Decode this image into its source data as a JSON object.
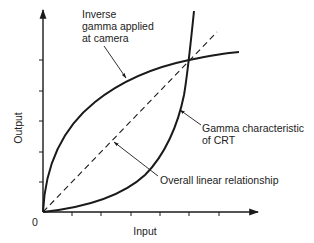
{
  "diagram": {
    "axes": {
      "x_label": "Input",
      "y_label": "Output",
      "origin_label": "0",
      "x_ticks": 6,
      "y_ticks": 5
    },
    "annotations": {
      "inverse_gamma": [
        "Inverse",
        "gamma applied",
        "at camera"
      ],
      "gamma_crt": [
        "Gamma characteristic",
        "of CRT"
      ],
      "linear": "Overall linear relationship"
    },
    "curves": [
      {
        "name": "inverse-gamma-curve",
        "description": "Inverse gamma applied at camera",
        "shape": "concave"
      },
      {
        "name": "gamma-curve",
        "description": "Gamma characteristic of CRT",
        "shape": "convex"
      },
      {
        "name": "linear-line",
        "description": "Overall linear relationship",
        "style": "dashed"
      }
    ],
    "colors": {
      "line": "#1a1a1a",
      "text": "#222222",
      "background": "#ffffff"
    }
  }
}
